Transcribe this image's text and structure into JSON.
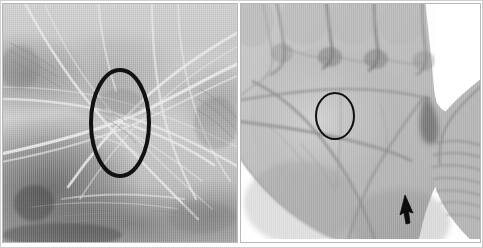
{
  "figure": {
    "background_color": "#ffffff",
    "frame_color": "#b8b8b8",
    "width": 483,
    "height": 248,
    "panel_count": 2
  },
  "panels": [
    {
      "id": "left",
      "name": "magnified-palm-skin-panel",
      "caption": "",
      "description": "Magnified grayscale close-up of palmar skin showing ridge and crease detail",
      "image_kind": "grayscale-photograph",
      "tone": "mid-gray",
      "x": 2,
      "y": 3,
      "width": 236,
      "height": 240,
      "annotations": [
        {
          "name": "ellipse-marker",
          "shape": "ellipse",
          "color": "#111111",
          "stroke_width": 4,
          "center_x": 118,
          "center_y": 120,
          "radius_x": 29,
          "radius_y": 53,
          "label": ""
        }
      ]
    },
    {
      "id": "right",
      "name": "whole-palm-panel",
      "caption": "",
      "description": "Grayscale photograph of an open right palm with four fingers cropped at top and the thumb at the right",
      "image_kind": "grayscale-photograph",
      "tone": "light-gray",
      "x": 240,
      "y": 3,
      "width": 241,
      "height": 240,
      "annotations": [
        {
          "name": "ellipse-marker",
          "shape": "ellipse",
          "color": "#111111",
          "stroke_width": 2,
          "center_x": 95,
          "center_y": 113,
          "radius_x": 19,
          "radius_y": 23,
          "label": ""
        },
        {
          "name": "arrow-marker",
          "shape": "arrow",
          "direction": "up",
          "color": "#0d0d0d",
          "tip_x": 165,
          "tip_y": 192,
          "length": 25,
          "label": ""
        }
      ]
    }
  ],
  "colors": {
    "background": "#ffffff",
    "frame": "#b8b8b8",
    "annotation": "#111111",
    "skin_light": "#d8d8d8",
    "skin_mid": "#b4b4b4",
    "skin_dark": "#6e6e6e"
  },
  "text_elements": []
}
